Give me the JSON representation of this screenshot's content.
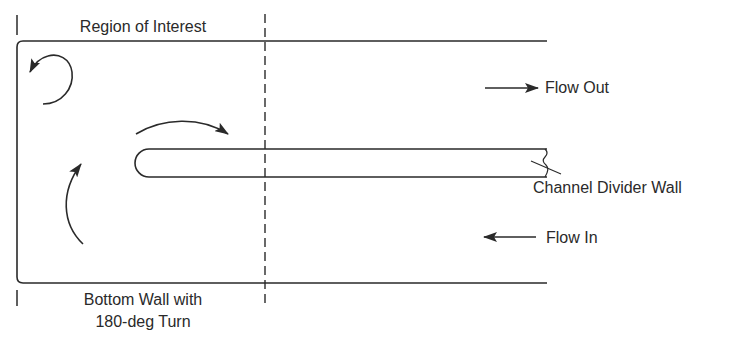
{
  "diagram": {
    "type": "flow-channel-schematic",
    "labels": {
      "region_of_interest": "Region of Interest",
      "bottom_wall_line1": "Bottom Wall with",
      "bottom_wall_line2": "180-deg Turn",
      "flow_out": "Flow Out",
      "flow_in": "Flow In",
      "channel_divider_wall": "Channel Divider Wall"
    },
    "colors": {
      "line": "#2a2a2a",
      "background": "#ffffff"
    },
    "elements": {
      "outer_channel": {
        "top_y": 41,
        "bottom_y": 283,
        "left_x": 17,
        "right_x": 547
      },
      "divider_wall": {
        "top_y": 149,
        "bottom_y": 177,
        "left_x": 135,
        "right_x": 547
      },
      "region_boundary_dashed_x": 265,
      "flow_out_arrow": {
        "direction": "right",
        "x1": 485,
        "x2": 538,
        "y": 88
      },
      "flow_in_arrow": {
        "direction": "left",
        "x1": 537,
        "x2": 485,
        "y": 237
      },
      "vortex_arrows": [
        "counter-clockwise-recirculation",
        "over-divider-tip",
        "upward-turn"
      ]
    }
  }
}
